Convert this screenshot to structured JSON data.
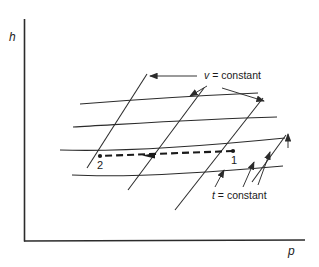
{
  "figure": {
    "kind": "thermodynamic-chart",
    "background_color": "#ffffff",
    "line_color": "#2b2b2b"
  },
  "axes": {
    "y_label": "h",
    "x_label": "p",
    "y_axis": {
      "x": 24,
      "y_top": 19,
      "y_bottom": 241
    },
    "x_axis": {
      "y": 241,
      "x_left": 24,
      "x_right": 305
    }
  },
  "annotations": {
    "v_constant": "v = constant",
    "v_symbol": "v",
    "v_text": " = constant",
    "t_constant": "t = constant",
    "t_symbol": "t",
    "t_text": " = constant"
  },
  "state_points": [
    {
      "label": "1",
      "x": 233,
      "y": 151,
      "text_x": 231,
      "text_y": 155
    },
    {
      "label": "2",
      "x": 100,
      "y": 156,
      "text_x": 98,
      "text_y": 159
    }
  ],
  "process": {
    "direction": "1 to 2",
    "style": "dashed-with-arrowhead",
    "from_x": 233,
    "from_y": 151,
    "to_x": 100,
    "to_y": 155
  },
  "chart_data": {
    "type": "line",
    "title": "",
    "xlabel": "p",
    "ylabel": "h",
    "grid": false,
    "series": [
      {
        "name": "v = constant (upper)",
        "note": "nearly-horizontal curve, upper"
      },
      {
        "name": "v = constant (middle)",
        "note": "nearly-horizontal curve, middle"
      },
      {
        "name": "v = constant (lower)",
        "note": "nearly-horizontal curve, lower through states 1 and 2"
      },
      {
        "name": "v = constant (lowest)",
        "note": "nearly-horizontal curve, lowest right segment"
      },
      {
        "name": "t = constant (a)",
        "note": "steep diagonal line, leftmost"
      },
      {
        "name": "t = constant (b)",
        "note": "steep diagonal line, middle"
      },
      {
        "name": "t = constant (c)",
        "note": "steep diagonal line, right"
      },
      {
        "name": "t = constant (d)",
        "note": "steep diagonal line, rightmost"
      }
    ],
    "annotations": [
      "v = constant",
      "t = constant",
      "1",
      "2"
    ]
  }
}
